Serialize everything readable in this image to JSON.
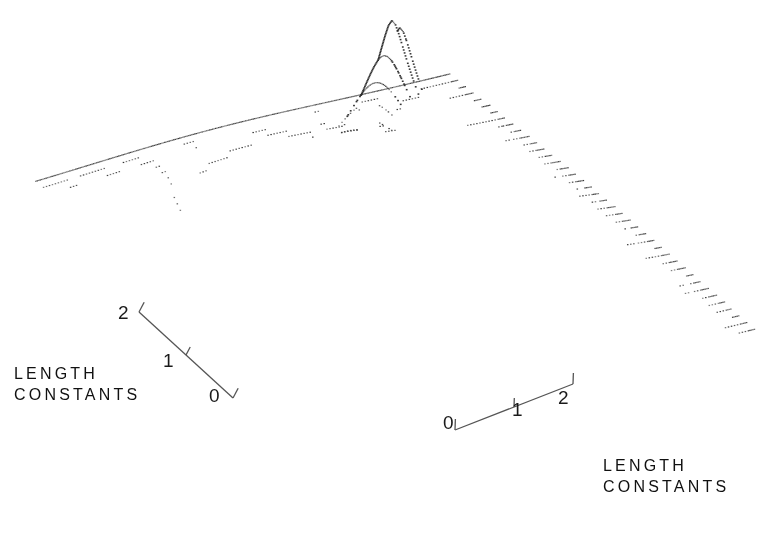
{
  "figure": {
    "kind": "three-dimensional-dotted-surface-mesh",
    "background_color": "#ffffff",
    "ink_color": "#2a2a2a",
    "axis_line_color": "#555555"
  },
  "axes": {
    "left": {
      "caption_line1": "LENGTH",
      "caption_line2": "CONSTANTS",
      "tick_labels": [
        "2",
        "1",
        "0"
      ],
      "range": [
        0,
        2
      ],
      "label_2_pos": {
        "x": 118,
        "y": 303
      },
      "label_1_pos": {
        "x": 163,
        "y": 351
      },
      "label_0_pos": {
        "x": 209,
        "y": 386
      },
      "caption_pos": {
        "x": 14,
        "y": 363
      },
      "line_start": {
        "x": 139,
        "y": 312
      },
      "line_end": {
        "x": 233,
        "y": 398
      }
    },
    "right": {
      "caption_line1": "LENGTH",
      "caption_line2": "CONSTANTS",
      "tick_labels": [
        "0",
        "1",
        "2"
      ],
      "range": [
        0,
        2
      ],
      "label_0_pos": {
        "x": 443,
        "y": 413
      },
      "label_1_pos": {
        "x": 512,
        "y": 400
      },
      "label_2_pos": {
        "x": 558,
        "y": 388
      },
      "caption_pos": {
        "x": 603,
        "y": 455
      },
      "line_start": {
        "x": 455,
        "y": 430
      },
      "line_end": {
        "x": 573,
        "y": 384
      }
    }
  },
  "chart_data": {
    "type": "surface",
    "title": "",
    "subtitle": "",
    "xlabel": "LENGTH CONSTANTS",
    "ylabel": "LENGTH CONSTANTS",
    "zlabel": "",
    "xlim": [
      0,
      2
    ],
    "ylim": [
      0,
      2
    ],
    "grid": false,
    "legend": false,
    "legend_position": "none",
    "render_style": "dotted-wireframe",
    "mesh_rows": 40,
    "mesh_cols": 120,
    "projection": {
      "corner_left": {
        "x": 35,
        "y": 185
      },
      "corner_back_peak": {
        "x": 400,
        "y": 12
      },
      "corner_right": {
        "x": 755,
        "y": 330
      },
      "corner_front": {
        "x": 340,
        "y": 440
      }
    },
    "peak": {
      "apex_px": {
        "x": 400,
        "y": 12
      },
      "description": "sharp singular peak near back-center of grid",
      "source_u": 0.5,
      "source_v": 0.5,
      "amplitude": 1.0,
      "decay": "exponential-radial"
    },
    "dense_region": {
      "center_px": {
        "x": 500,
        "y": 178
      },
      "description": "crowded convergence of mesh curves on steep right flank"
    },
    "x": [
      0,
      0.25,
      0.5,
      0.75,
      1,
      1.25,
      1.5,
      1.75,
      2
    ],
    "y": [
      0,
      0.25,
      0.5,
      0.75,
      1,
      1.25,
      1.5,
      1.75,
      2
    ],
    "z": [
      [
        0.04,
        0.06,
        0.08,
        0.1,
        0.11,
        0.1,
        0.08,
        0.06,
        0.04
      ],
      [
        0.06,
        0.09,
        0.14,
        0.19,
        0.22,
        0.19,
        0.14,
        0.09,
        0.06
      ],
      [
        0.08,
        0.14,
        0.24,
        0.37,
        0.45,
        0.37,
        0.24,
        0.14,
        0.08
      ],
      [
        0.1,
        0.19,
        0.37,
        0.64,
        0.82,
        0.64,
        0.37,
        0.19,
        0.1
      ],
      [
        0.11,
        0.22,
        0.45,
        0.82,
        1.0,
        0.82,
        0.45,
        0.22,
        0.11
      ],
      [
        0.1,
        0.19,
        0.37,
        0.64,
        0.82,
        0.64,
        0.37,
        0.19,
        0.1
      ],
      [
        0.08,
        0.14,
        0.24,
        0.37,
        0.45,
        0.37,
        0.24,
        0.14,
        0.08
      ],
      [
        0.06,
        0.09,
        0.14,
        0.19,
        0.22,
        0.19,
        0.14,
        0.09,
        0.06
      ],
      [
        0.04,
        0.06,
        0.08,
        0.1,
        0.11,
        0.1,
        0.08,
        0.06,
        0.04
      ]
    ]
  }
}
